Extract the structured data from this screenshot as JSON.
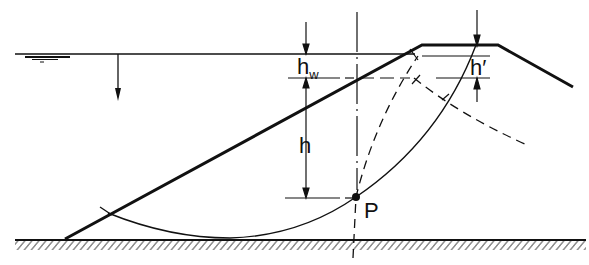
{
  "diagram": {
    "colors": {
      "line": "#111111",
      "background": "#ffffff"
    },
    "labels": {
      "hw_main": "h",
      "hw_sub": "w",
      "h": "h",
      "h_prime": "h′",
      "point": "P"
    },
    "elements": [
      "water-surface-line",
      "water-level-symbol",
      "water-pressure-arrow",
      "embankment-profile",
      "ground-line-hatched",
      "vertical-centerline",
      "slip-circle-arc",
      "dashed-flow-line",
      "dashed-equipotential-line",
      "dimension-hw",
      "dimension-h",
      "dimension-h-prime",
      "point-P"
    ]
  }
}
